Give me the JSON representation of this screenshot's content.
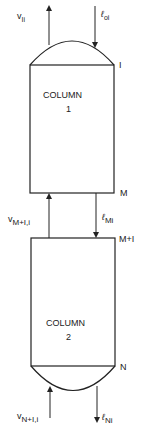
{
  "diagram": {
    "columns": [
      {
        "title": "COLUMN",
        "number": "1",
        "top_stage": "I",
        "bottom_stage": "M"
      },
      {
        "title": "COLUMN",
        "number": "2",
        "top_stage": "M+I",
        "bottom_stage": "N"
      }
    ],
    "streams": {
      "top_vapor": {
        "main": "v",
        "sub": "Ii"
      },
      "top_liquid": {
        "main": "ℓ",
        "sub": "oi"
      },
      "interstage_vapor": {
        "main": "v",
        "sub": "M+I,i"
      },
      "interstage_liquid": {
        "main": "ℓ",
        "sub": "Mi"
      },
      "bottom_vapor": {
        "main": "v",
        "sub": "N+I,i"
      },
      "bottom_liquid": {
        "main": "ℓ",
        "sub": "Ni"
      }
    },
    "colors": {
      "line": "#222222",
      "background": "#ffffff"
    }
  }
}
